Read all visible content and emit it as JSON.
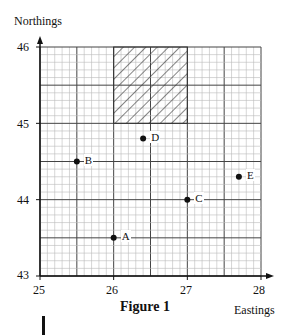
{
  "chart_data": {
    "type": "scatter",
    "title": "Figure 1",
    "xlabel": "Eastings",
    "ylabel": "Northings",
    "xlim": [
      25,
      28
    ],
    "ylim": [
      43,
      46
    ],
    "x_ticks": [
      "25",
      "26",
      "27",
      "28"
    ],
    "y_ticks": [
      "43",
      "44",
      "45",
      "46"
    ],
    "grid": true,
    "points": [
      {
        "label": "A",
        "x": 26.0,
        "y": 43.5
      },
      {
        "label": "B",
        "x": 25.5,
        "y": 44.5
      },
      {
        "label": "C",
        "x": 27.0,
        "y": 44.0
      },
      {
        "label": "D",
        "x": 26.4,
        "y": 44.8
      },
      {
        "label": "E",
        "x": 27.7,
        "y": 44.3
      }
    ],
    "shaded_region": {
      "x": [
        26,
        27
      ],
      "y": [
        45,
        46
      ],
      "pattern": "diagonal-hatch"
    }
  }
}
